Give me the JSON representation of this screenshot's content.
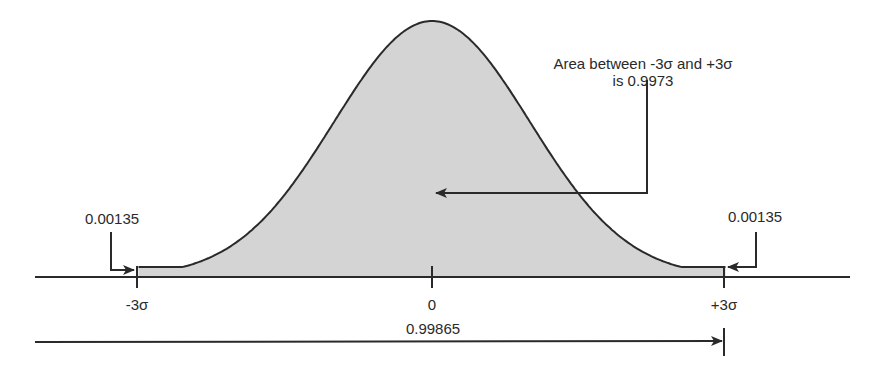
{
  "chart_data": {
    "type": "area",
    "title": "",
    "xlabel": "",
    "ylabel": "",
    "x_tick_labels": [
      "-3σ",
      "0",
      "+3σ"
    ],
    "x_ticks": [
      -3,
      0,
      3
    ],
    "xlim": [
      -3.5,
      4.2
    ],
    "shaded_range": [
      -3,
      3
    ],
    "grid": false,
    "legend": null,
    "annotations": {
      "center_area": {
        "line1": "Area between -3σ and +3σ",
        "line2": "is 0.9973",
        "value": 0.9973
      },
      "left_tail": {
        "text": "0.00135",
        "value": 0.00135
      },
      "right_tail": {
        "text": "0.00135",
        "value": 0.00135
      },
      "cumulative": {
        "text": "0.99865",
        "value": 0.99865
      }
    },
    "colors": {
      "fill": "#d4d4d4",
      "line": "#2a2a2a"
    }
  }
}
